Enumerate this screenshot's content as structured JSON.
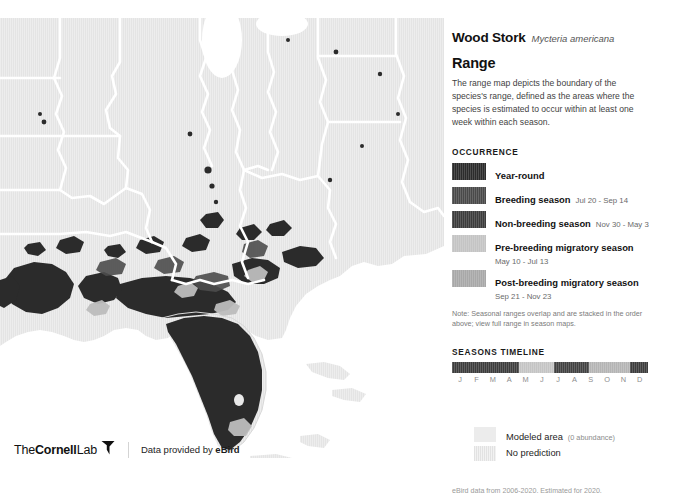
{
  "species": {
    "common_name": "Wood Stork",
    "scientific_name": "Mycteria americana"
  },
  "section": {
    "title": "Range",
    "description": "The range map depicts the boundary of the species's range, defined as the areas where the species is estimated to occur within at least one week within each season."
  },
  "occurrence": {
    "heading": "OCCURRENCE",
    "items": [
      {
        "label": "Year-round",
        "dates": "",
        "color": "#2b2b2b",
        "dates_below": false
      },
      {
        "label": "Breeding season",
        "dates": "Jul 20 - Sep 14",
        "color": "#494949",
        "dates_below": false
      },
      {
        "label": "Non-breeding season",
        "dates": "Nov 30 - May 3",
        "color": "#3c3c3c",
        "dates_below": false
      },
      {
        "label": "Pre-breeding migratory season",
        "dates": "May 10 - Jul 13",
        "color": "#c4c4c4",
        "dates_below": true
      },
      {
        "label": "Post-breeding migratory season",
        "dates": "Sep 21 - Nov 23",
        "color": "#a8a8a8",
        "dates_below": true
      }
    ],
    "note": "Note: Seasonal ranges overlap and are stacked in the order above; view full range in season maps."
  },
  "timeline": {
    "heading": "SEASONS TIMELINE",
    "months": [
      "J",
      "F",
      "M",
      "A",
      "M",
      "J",
      "J",
      "A",
      "S",
      "O",
      "N",
      "D"
    ],
    "segments": [
      {
        "name": "non-breeding",
        "start_pct": 0,
        "width_pct": 34.0,
        "color": "#3c3c3c"
      },
      {
        "name": "pre-breeding",
        "start_pct": 34.0,
        "width_pct": 18.0,
        "color": "#c4c4c4"
      },
      {
        "name": "breeding",
        "start_pct": 52.0,
        "width_pct": 18.0,
        "color": "#414141"
      },
      {
        "name": "post-breeding",
        "start_pct": 70.0,
        "width_pct": 21.0,
        "color": "#b4b4b4"
      },
      {
        "name": "non-breeding-end",
        "start_pct": 91.0,
        "width_pct": 9.0,
        "color": "#3c3c3c"
      }
    ]
  },
  "extra_legend": {
    "modeled_area_label": "Modeled area",
    "modeled_area_sub": "(0 abundance)",
    "modeled_area_color": "#ececec",
    "no_prediction_label": "No prediction",
    "no_prediction_color": "#e3e3e3"
  },
  "credits": {
    "source_line": "eBird data from 2006-2020. Estimated for 2020.",
    "citation": "Fink, D., T. Auer, A. Johnston, M. Strimas-Mackey, O. Robinson, S. Ligocki, W. Hochachka, L. Jaromczyk, C. Wood, I. Davies, M. Iliff, L. Seitz. 2021. eBird Status and Trends, Data Version: 2020; Released: 2021. Cornell Lab of Ornithology, Ithaca, New York. https://doi.org/10.2173/ebirdst.2020"
  },
  "footer": {
    "logo_the": "The",
    "logo_cornell": "Cornell",
    "logo_lab": "Lab",
    "data_credit_prefix": "Data provided by ",
    "data_credit_brand": "eBird"
  },
  "map": {
    "land_color": "#e4e4e4",
    "border_color": "#ffffff",
    "year_round_color": "#2b2b2b",
    "breeding_color": "#4a4a4a",
    "migratory_color": "#b0b0b0",
    "background_color": "#ffffff"
  }
}
